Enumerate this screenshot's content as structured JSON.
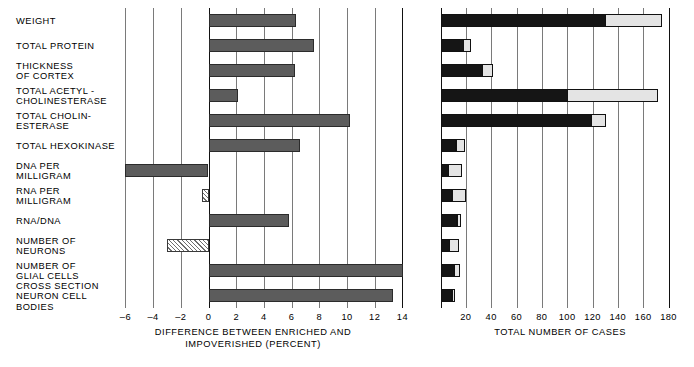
{
  "chart_data": [
    {
      "type": "bar",
      "id": "left-panel",
      "title": "",
      "orientation": "horizontal",
      "xlabel": "DIFFERENCE BETWEEN ENRICHED AND\nIMPOVERISHED (PERCENT)",
      "ylabel": "",
      "xlim": [
        -6,
        14
      ],
      "xticks": [
        -6,
        -4,
        -2,
        0,
        2,
        4,
        6,
        8,
        10,
        12,
        14
      ],
      "xticklabels": [
        "–6",
        "–4",
        "–2",
        "0",
        "2",
        "4",
        "6",
        "8",
        "10",
        "12",
        "14"
      ],
      "grid": true,
      "legend": false,
      "categories": [
        "WEIGHT",
        "TOTAL PROTEIN",
        "THICKNESS\nOF CORTEX",
        "TOTAL ACETYL -\nCHOLINESTERASE",
        "TOTAL CHOLIN-\nESTERASE",
        "TOTAL HEXOKINASE",
        "DNA PER\nMILLIGRAM",
        "RNA PER\nMILLIGRAM",
        "RNA/DNA",
        "NUMBER OF\nNEURONS",
        "NUMBER OF\nGLIAL CELLS",
        "CROSS SECTION\nNEURON CELL\nBODIES"
      ],
      "values": [
        6.3,
        7.6,
        6.2,
        2.1,
        10.2,
        6.6,
        -6.0,
        -0.5,
        5.8,
        -3.0,
        14.0,
        13.3
      ],
      "fill_styles": [
        "solid",
        "solid",
        "solid",
        "solid",
        "solid",
        "solid",
        "solid",
        "hatch",
        "solid",
        "hatch",
        "solid",
        "solid"
      ]
    },
    {
      "type": "bar",
      "id": "right-panel",
      "title": "",
      "orientation": "horizontal",
      "stacked": true,
      "xlabel": "TOTAL NUMBER OF CASES",
      "ylabel": "",
      "xlim": [
        0,
        185
      ],
      "xticks": [
        20,
        40,
        60,
        80,
        100,
        120,
        140,
        160,
        180
      ],
      "xticklabels": [
        "20",
        "40",
        "60",
        "80",
        "100",
        "120",
        "140",
        "160",
        "180"
      ],
      "grid": true,
      "legend": false,
      "categories": [
        "WEIGHT",
        "TOTAL PROTEIN",
        "THICKNESS OF CORTEX",
        "TOTAL ACETYLCHOLINESTERASE",
        "TOTAL CHOLINESTERASE",
        "TOTAL HEXOKINASE",
        "DNA PER MILLIGRAM",
        "RNA PER MILLIGRAM",
        "RNA/DNA",
        "NUMBER OF NEURONS",
        "NUMBER OF GLIAL CELLS",
        "CROSS SECTION NEURON CELL BODIES"
      ],
      "series": [
        {
          "name": "dark-segment",
          "color": "#151515",
          "values": [
            130,
            18,
            33,
            100,
            119,
            12,
            6,
            9,
            13,
            7,
            11,
            9
          ]
        },
        {
          "name": "light-segment",
          "color": "#e4e4e4",
          "values": [
            45,
            6,
            9,
            72,
            12,
            7,
            11,
            11,
            3,
            8,
            5,
            2
          ]
        }
      ],
      "totals": [
        175,
        24,
        42,
        172,
        131,
        19,
        17,
        20,
        16,
        15,
        16,
        11
      ]
    }
  ],
  "figure": {
    "left_panel": {
      "axis_title": "DIFFERENCE BETWEEN ENRICHED AND\nIMPOVERISHED (PERCENT)",
      "ticks": [
        "–6",
        "–4",
        "–2",
        "0",
        "2",
        "4",
        "6",
        "8",
        "10",
        "12",
        "14"
      ]
    },
    "right_panel": {
      "axis_title": "TOTAL NUMBER OF CASES",
      "ticks": [
        "20",
        "40",
        "60",
        "80",
        "100",
        "120",
        "140",
        "160",
        "180"
      ]
    },
    "row_labels": [
      "WEIGHT",
      "TOTAL PROTEIN",
      "THICKNESS\nOF CORTEX",
      "TOTAL ACETYL -\nCHOLINESTERASE",
      "TOTAL CHOLIN-\nESTERASE",
      "TOTAL HEXOKINASE",
      "DNA PER\nMILLIGRAM",
      "RNA PER\nMILLIGRAM",
      "RNA/DNA",
      "NUMBER OF\nNEURONS",
      "NUMBER OF\nGLIAL CELLS",
      "CROSS SECTION\nNEURON CELL\nBODIES"
    ]
  }
}
